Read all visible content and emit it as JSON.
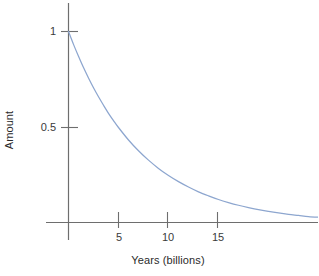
{
  "chart_data": {
    "type": "line",
    "title": "",
    "subtitle": "",
    "xlabel": "Years (billions)",
    "ylabel": "Amount",
    "xlim": [
      0,
      25.2
    ],
    "ylim": [
      0,
      1.1
    ],
    "grid": false,
    "legend": null,
    "x_ticks": [
      {
        "value": 5,
        "label": "5"
      },
      {
        "value": 10,
        "label": "10"
      },
      {
        "value": 15,
        "label": "15"
      }
    ],
    "y_ticks": [
      {
        "value": 0.5,
        "label": "0.5"
      },
      {
        "value": 1,
        "label": "1"
      }
    ],
    "series": [
      {
        "name": "Amount remaining",
        "color": "#8da6cf",
        "x": [
          0,
          0.5,
          1,
          1.5,
          2,
          2.5,
          3,
          3.5,
          4,
          4.5,
          5,
          6,
          7,
          8,
          9,
          10,
          11,
          12,
          13,
          14,
          15,
          16,
          17,
          18,
          19,
          20,
          21,
          22,
          23,
          24,
          25.2
        ],
        "values": [
          1,
          0.933,
          0.871,
          0.812,
          0.758,
          0.707,
          0.66,
          0.616,
          0.574,
          0.536,
          0.5,
          0.435,
          0.379,
          0.33,
          0.287,
          0.25,
          0.218,
          0.19,
          0.165,
          0.144,
          0.125,
          0.109,
          0.095,
          0.083,
          0.072,
          0.063,
          0.055,
          0.048,
          0.042,
          0.036,
          0.032
        ]
      }
    ],
    "annotations": []
  },
  "axes": {
    "y_axis_label": "Amount",
    "x_axis_label": "Years (billions)",
    "y_tick_1": "1",
    "y_tick_05": "0.5",
    "x_tick_5": "5",
    "x_tick_10": "10",
    "x_tick_15": "15"
  },
  "colors": {
    "curve": "#8da6cf",
    "axis": "#6e6e6e",
    "text": "#2b2b2b",
    "background": "#ffffff"
  }
}
